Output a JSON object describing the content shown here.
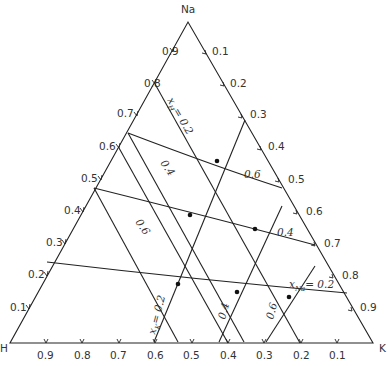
{
  "diagram": {
    "type": "ternary",
    "vertices": {
      "top": "Na",
      "left": "H",
      "right": "K"
    },
    "left_axis_ticks": [
      "0.9",
      "0.8",
      "0.7",
      "0.6",
      "0.5",
      "0.4",
      "0.3",
      "0.2",
      "0.1"
    ],
    "right_axis_ticks": [
      "0.1",
      "0.2",
      "0.3",
      "0.4",
      "0.5",
      "0.6",
      "0.7",
      "0.8",
      "0.9"
    ],
    "bottom_axis_ticks": [
      "0.9",
      "0.8",
      "0.7",
      "0.6",
      "0.5",
      "0.4",
      "0.3",
      "0.2",
      "0.1"
    ],
    "line_labels": {
      "xH_02": "x",
      "xH_sub": "H",
      "xH_val": "= 0.2",
      "xH_04": "0.4",
      "xH_06": "0.6",
      "xK_02": "x",
      "xK_sub": "K",
      "xK_val": "= 0.2",
      "xK_04": "0.4",
      "xK_06": "0.6",
      "xNa_02": "x",
      "xNa_sub": "Na",
      "xNa_val": "= 0.2",
      "xNa_04": "0.4",
      "xNa_06": "0.6"
    }
  }
}
